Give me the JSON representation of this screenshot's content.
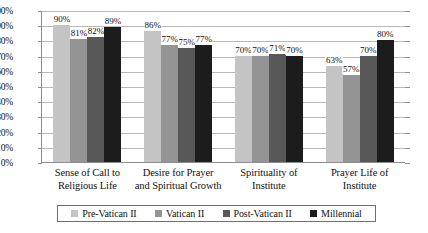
{
  "chart_data": {
    "type": "bar",
    "title": "",
    "subtitle": "",
    "xlabel": "",
    "ylabel": "",
    "ylim": [
      0,
      100
    ],
    "ytick_labels": [
      "100%",
      "90%",
      "80%",
      "70%",
      "60%",
      "50%",
      "40%",
      "30%",
      "20%",
      "10%",
      "0%"
    ],
    "ytick_values": [
      100,
      90,
      80,
      70,
      60,
      50,
      40,
      30,
      20,
      10,
      0
    ],
    "grid": true,
    "legend_position": "bottom",
    "value_labels_suffix": "%",
    "categories": [
      "Sense of Call to Religious Life",
      "Desire for Prayer and Spiritual Growth",
      "Spirituality of Institute",
      "Prayer Life of Institute"
    ],
    "category_lines": [
      [
        "Sense of Call to",
        "Religious Life"
      ],
      [
        "Desire for Prayer",
        "and Spiritual Growth"
      ],
      [
        "Spirituality of",
        "Institute"
      ],
      [
        "Prayer Life of",
        "Institute"
      ]
    ],
    "series": [
      {
        "name": "Pre-Vatican II",
        "color": "#c4c4c4",
        "values": [
          90,
          86,
          70,
          63
        ],
        "labels": [
          "90%",
          "86%",
          "70%",
          "63%"
        ]
      },
      {
        "name": "Vatican II",
        "color": "#949494",
        "values": [
          81,
          77,
          70,
          57
        ],
        "labels": [
          "81%",
          "77%",
          "70%",
          "57%"
        ]
      },
      {
        "name": "Post-Vatican II",
        "color": "#585858",
        "values": [
          82,
          75,
          71,
          70
        ],
        "labels": [
          "82%",
          "75%",
          "71%",
          "70%"
        ]
      },
      {
        "name": "Millennial",
        "color": "#1c1c1c",
        "values": [
          89,
          77,
          70,
          80
        ],
        "labels": [
          "89%",
          "77%",
          "70%",
          "80%"
        ]
      }
    ]
  }
}
